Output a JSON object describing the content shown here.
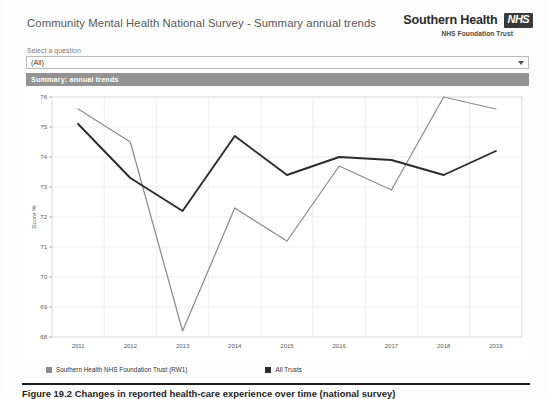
{
  "header": {
    "title": "Community Mental Health National Survey - Summary annual trends",
    "brand_name": "Southern Health",
    "brand_logo_text": "NHS",
    "brand_subtitle": "NHS Foundation Trust"
  },
  "selector": {
    "label": "Select a question",
    "value": "(All)",
    "placeholder": "(All)",
    "arrow_icon": "chevron-down-icon"
  },
  "section": {
    "title": "Summary: annual trends"
  },
  "caption": {
    "text": "Figure 19.2   Changes in reported health-care experience over time (national survey)"
  },
  "colors": {
    "series_southern": "#8c8c8c",
    "series_all_trusts": "#2b2b2b",
    "section_bar": "#939393",
    "grid": "#e6e6ef",
    "axis_text": "#5a5a5a",
    "panel_border": "#d8d8e2"
  },
  "chart_data": {
    "type": "line",
    "title": "",
    "xlabel": "",
    "ylabel": "Score %",
    "categories": [
      "2011",
      "2012",
      "2013",
      "2014",
      "2015",
      "2016",
      "2017",
      "2018",
      "2019"
    ],
    "x": [
      2011,
      2012,
      2013,
      2014,
      2015,
      2016,
      2017,
      2018,
      2019
    ],
    "ylim": [
      68,
      76
    ],
    "yticks": [
      68,
      69,
      70,
      71,
      72,
      73,
      74,
      75,
      76
    ],
    "grid": true,
    "legend_position": "bottom-left",
    "series": [
      {
        "name": "Southern Health NHS Foundation Trust (RW1)",
        "color": "#8c8c8c",
        "values": [
          75.6,
          74.5,
          68.2,
          72.3,
          71.2,
          73.7,
          72.9,
          76.0,
          75.6
        ]
      },
      {
        "name": "All Trusts",
        "color": "#2b2b2b",
        "values": [
          75.1,
          73.3,
          72.2,
          74.7,
          73.4,
          74.0,
          73.9,
          73.4,
          74.2
        ]
      }
    ]
  }
}
